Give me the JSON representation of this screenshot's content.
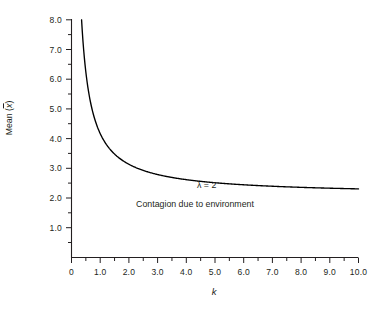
{
  "figure": {
    "background_color": "#ffffff",
    "axis_color": "#231f20",
    "curve_color": "#000000"
  },
  "axes": {
    "y_title_prefix": "Mean (",
    "y_title_var": "x",
    "y_title_suffix": ")",
    "x_title": "k",
    "y_ticks": [
      "8.0",
      "7.0",
      "6.0",
      "5.0",
      "4.0",
      "3.0",
      "2.0",
      "1.0"
    ],
    "x_ticks": [
      "0",
      "1.0",
      "2.0",
      "3.0",
      "4.0",
      "5.0",
      "6.0",
      "7.0",
      "8.0",
      "9.0",
      "10.0"
    ]
  },
  "annotations": {
    "lambda": "λ = 2",
    "caption": "Contagion due to environment"
  },
  "chart_data": {
    "type": "line",
    "title": "",
    "subtitle": "",
    "xlabel": "k",
    "ylabel": "Mean (x̄)",
    "xlim": [
      0,
      10
    ],
    "ylim": [
      0.5,
      8.0
    ],
    "grid": false,
    "legend": null,
    "x_tick_values": [
      0,
      1,
      2,
      3,
      4,
      5,
      6,
      7,
      8,
      9,
      10
    ],
    "x_minor_tick_step": 0.5,
    "y_tick_values": [
      1,
      2,
      3,
      4,
      5,
      6,
      7,
      8
    ],
    "y_minor_tick_step": 0.5,
    "asymptote": 2.1,
    "annotations": [
      {
        "text": "λ = 2",
        "x": 4.35,
        "y": 2.45
      },
      {
        "text": "Contagion due to environment",
        "x": 2.6,
        "y": 1.85
      }
    ],
    "series": [
      {
        "name": "Mean vs k",
        "formula": "mean = 2.1 + 2.07 / k",
        "x": [
          0.35,
          0.4,
          0.45,
          0.5,
          0.55,
          0.6,
          0.65,
          0.7,
          0.8,
          0.9,
          1.0,
          1.2,
          1.4,
          1.6,
          1.8,
          2.0,
          2.5,
          3.0,
          3.5,
          4.0,
          5.0,
          6.0,
          7.0,
          8.0,
          9.0,
          10.0
        ],
        "y": [
          8.0,
          7.28,
          6.7,
          6.24,
          5.86,
          5.55,
          5.28,
          5.06,
          4.69,
          4.4,
          4.17,
          3.83,
          3.58,
          3.39,
          3.25,
          3.14,
          2.93,
          2.79,
          2.69,
          2.62,
          2.51,
          2.45,
          2.4,
          2.36,
          2.33,
          2.31
        ]
      }
    ]
  }
}
